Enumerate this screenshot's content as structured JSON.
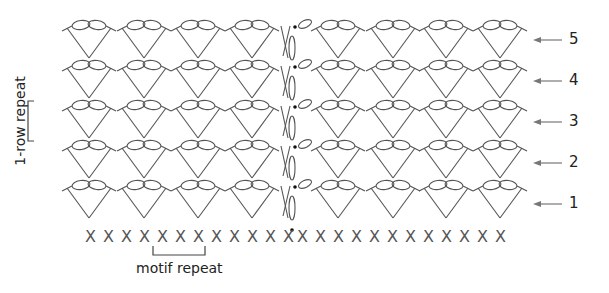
{
  "diagram": {
    "type": "crochet-stitch-chart",
    "rows": [
      {
        "number": "1",
        "label": "1",
        "fan_top_y": 182,
        "v_bottom_y": 222,
        "arrow_y": 204
      },
      {
        "number": "2",
        "label": "2",
        "fan_top_y": 142,
        "v_bottom_y": 182,
        "arrow_y": 163
      },
      {
        "number": "3",
        "label": "3",
        "fan_top_y": 102,
        "v_bottom_y": 142,
        "arrow_y": 122
      },
      {
        "number": "4",
        "label": "4",
        "fan_top_y": 62,
        "v_bottom_y": 102,
        "arrow_y": 81
      },
      {
        "number": "5",
        "label": "5",
        "fan_top_y": 22,
        "v_bottom_y": 62,
        "arrow_y": 40
      }
    ],
    "fan_centers_x": [
      89,
      144,
      198,
      252,
      338,
      393,
      446,
      500
    ],
    "foundation": {
      "symbol": "X",
      "left_count": 12,
      "right_count": 12,
      "y": 237,
      "left_start_x": 90,
      "right_start_x": 302,
      "spacing": 18
    },
    "turning_chain_x": 288,
    "labels": {
      "row_repeat": "1-row repeat",
      "motif_repeat": "motif repeat"
    },
    "colors": {
      "stitch": "#555555",
      "arrow": "#777777",
      "text": "#222222",
      "background": "#ffffff"
    }
  }
}
